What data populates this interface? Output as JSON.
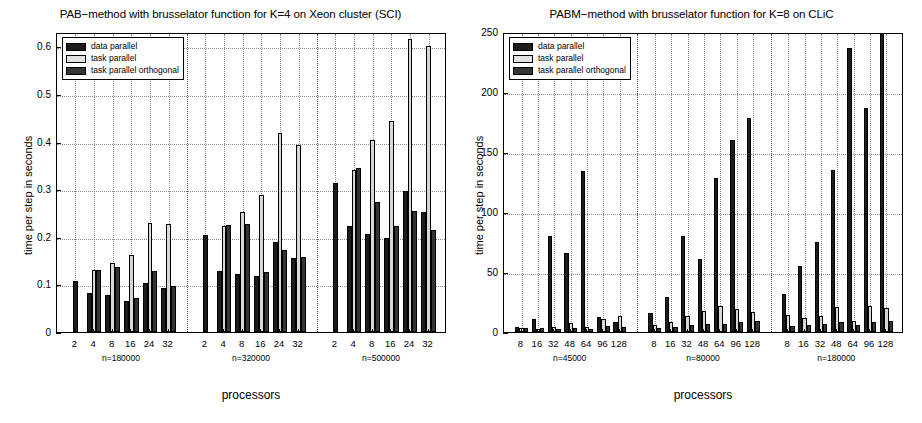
{
  "figures": [
    {
      "id": "left",
      "title": "PAB−method with brusselator function for K=4 on Xeon cluster (SCI)",
      "ylabel": "time per step in seconds",
      "xlabel": "processors",
      "legend": [
        {
          "label": "data parallel",
          "series": "s0"
        },
        {
          "label": "task parallel",
          "series": "s1"
        },
        {
          "label": "task parallel orthogonal",
          "series": "s2"
        }
      ]
    },
    {
      "id": "right",
      "title": "PABM−method with brusselator function for K=8 on CLiC",
      "ylabel": "time per step in seconds",
      "xlabel": "processors",
      "legend": [
        {
          "label": "data parallel",
          "series": "s0"
        },
        {
          "label": "task parallel",
          "series": "s1"
        },
        {
          "label": "task parallel orthogonal",
          "series": "s2"
        }
      ]
    }
  ],
  "chart_data": [
    {
      "type": "bar",
      "id": "left",
      "title": "PAB−method with brusselator function for K=4 on Xeon cluster (SCI)",
      "xlabel": "processors",
      "ylabel": "time per step in seconds",
      "ylim": [
        0,
        0.63
      ],
      "yticks": [
        0,
        0.1,
        0.2,
        0.3,
        0.4,
        0.5,
        0.6
      ],
      "ytick_labels": [
        "0",
        "0.1",
        "0.2",
        "0.3",
        "0.4",
        "0.5",
        "0.6"
      ],
      "grid": true,
      "legend_position": "upper-left",
      "legend": [
        "data parallel",
        "task parallel",
        "task parallel orthogonal"
      ],
      "groups": [
        {
          "name": "n=180000",
          "categories": [
            "2",
            "4",
            "8",
            "16",
            "24",
            "32"
          ],
          "series": [
            {
              "name": "data parallel",
              "values": [
                0.108,
                0.082,
                0.078,
                0.066,
                0.103,
                0.093
              ]
            },
            {
              "name": "task parallel",
              "values": [
                null,
                0.13,
                0.145,
                0.161,
                0.228,
                0.227
              ]
            },
            {
              "name": "task parallel orthogonal",
              "values": [
                null,
                0.131,
                0.137,
                0.072,
                0.129,
                0.096
              ]
            }
          ]
        },
        {
          "name": "n=320000",
          "categories": [
            "2",
            "4",
            "8",
            "16",
            "24",
            "32"
          ],
          "series": [
            {
              "name": "data parallel",
              "values": [
                0.203,
                0.128,
                0.122,
                0.118,
                0.19,
                0.155
              ]
            },
            {
              "name": "task parallel",
              "values": [
                null,
                0.222,
                0.252,
                0.288,
                0.418,
                0.393
              ]
            },
            {
              "name": "task parallel orthogonal",
              "values": [
                null,
                0.225,
                0.227,
                0.125,
                0.172,
                0.157
              ]
            }
          ]
        },
        {
          "name": "n=500000",
          "categories": [
            "2",
            "4",
            "8",
            "16",
            "24",
            "32"
          ],
          "series": [
            {
              "name": "data parallel",
              "values": [
                0.313,
                0.222,
                0.205,
                0.197,
                0.296,
                0.253
              ]
            },
            {
              "name": "task parallel",
              "values": [
                null,
                0.341,
                0.404,
                0.444,
                0.616,
                0.601
              ]
            },
            {
              "name": "task parallel orthogonal",
              "values": [
                null,
                0.345,
                0.272,
                0.222,
                0.255,
                0.215
              ]
            }
          ]
        }
      ]
    },
    {
      "type": "bar",
      "id": "right",
      "title": "PABM−method with brusselator function for K=8 on CLiC",
      "xlabel": "processors",
      "ylabel": "time per step in seconds",
      "ylim": [
        0,
        250
      ],
      "yticks": [
        0,
        50,
        100,
        150,
        200,
        250
      ],
      "ytick_labels": [
        "0",
        "50",
        "100",
        "150",
        "200",
        "250"
      ],
      "grid": true,
      "legend_position": "upper-left",
      "legend": [
        "data parallel",
        "task parallel",
        "task parallel orthogonal"
      ],
      "groups": [
        {
          "name": "n=45000",
          "categories": [
            "8",
            "16",
            "32",
            "48",
            "64",
            "96",
            "128"
          ],
          "series": [
            {
              "name": "data parallel",
              "values": [
                4.0,
                10.5,
                80.0,
                66.0,
                134.0,
                12.5,
                8.0
              ]
            },
            {
              "name": "task parallel",
              "values": [
                3.0,
                2.5,
                4.0,
                7.5,
                4.5,
                11.0,
                13.0
              ]
            },
            {
              "name": "task parallel orthogonal",
              "values": [
                3.5,
                3.0,
                2.5,
                3.0,
                2.5,
                5.0,
                4.0
              ]
            }
          ]
        },
        {
          "name": "n=80000",
          "categories": [
            "8",
            "16",
            "32",
            "48",
            "64",
            "96",
            "128"
          ],
          "series": [
            {
              "name": "data parallel",
              "values": [
                16.0,
                29.0,
                80.0,
                61.0,
                128.0,
                160.0,
                178.0
              ]
            },
            {
              "name": "task parallel",
              "values": [
                5.5,
                8.5,
                13.0,
                17.5,
                22.0,
                19.0,
                17.0
              ]
            },
            {
              "name": "task parallel orthogonal",
              "values": [
                3.0,
                4.0,
                5.5,
                7.0,
                6.5,
                8.0,
                9.0
              ]
            }
          ]
        },
        {
          "name": "n=180000",
          "categories": [
            "8",
            "16",
            "32",
            "48",
            "64",
            "96",
            "128"
          ],
          "series": [
            {
              "name": "data parallel",
              "values": [
                32.0,
                55.0,
                75.0,
                135.0,
                237.0,
                187.0,
                255.0
              ]
            },
            {
              "name": "task parallel",
              "values": [
                14.0,
                12.0,
                13.0,
                21.0,
                9.0,
                22.0,
                20.0
              ]
            },
            {
              "name": "task parallel orthogonal",
              "values": [
                5.0,
                6.0,
                7.0,
                8.0,
                6.0,
                8.0,
                9.0
              ]
            }
          ]
        }
      ]
    }
  ]
}
